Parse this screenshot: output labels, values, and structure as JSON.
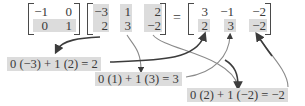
{
  "equation": {
    "matrix_a": {
      "rows": [
        [
          "−1",
          "0"
        ],
        [
          "0",
          "1"
        ]
      ],
      "highlighted_row": 1
    },
    "matrix_b": {
      "rows": [
        [
          "−3",
          "1",
          "2"
        ],
        [
          "2",
          "3",
          "−2"
        ]
      ],
      "highlighted_columns": [
        0,
        1,
        2
      ]
    },
    "equals": "=",
    "result": {
      "rows": [
        [
          "3",
          "−1",
          "−2"
        ],
        [
          "2",
          "3",
          "−2"
        ]
      ],
      "highlighted_row": 1
    }
  },
  "computations": [
    {
      "text": "0 (−3) + 1 (2) = 2"
    },
    {
      "text": "0 (1) + 1 (3) = 3"
    },
    {
      "text": "0 (2) + 1 (−2) = −2"
    }
  ],
  "colors": {
    "highlight": "#dcdcdc",
    "text": "#3a3a3a",
    "arrow_dark": "#3c3c3c",
    "arrow_light": "#9a9a9a"
  }
}
